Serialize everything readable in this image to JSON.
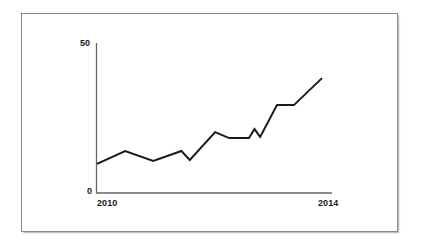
{
  "figure": {
    "frame_color": "#8a8a8a",
    "background": "#ffffff"
  },
  "chart_data": {
    "type": "line",
    "title": "",
    "subtitle": "",
    "xlabel": "",
    "ylabel": "",
    "grid": false,
    "legend": false,
    "legend_position": "none",
    "line_color": "#1a1a1a",
    "axis_color": "#666666",
    "xlim": [
      2010,
      2014
    ],
    "ylim": [
      0,
      50
    ],
    "y_tick_labels": [
      "0",
      "50"
    ],
    "y_ticks": [
      0,
      50
    ],
    "x_tick_labels": [
      "2010",
      "2014"
    ],
    "x_ticks": [
      2010,
      2014
    ],
    "x": [
      2010.0,
      2010.5,
      2011.0,
      2011.5,
      2011.65,
      2012.1,
      2012.35,
      2012.7,
      2012.8,
      2012.9,
      2013.2,
      2013.5,
      2014.0
    ],
    "values": [
      9.7,
      14.0,
      10.7,
      14.0,
      11.0,
      20.3,
      18.3,
      18.3,
      21.3,
      18.7,
      29.3,
      29.3,
      38.3
    ],
    "series": [
      {
        "name": "series-1",
        "values": [
          9.7,
          14.0,
          10.7,
          14.0,
          11.0,
          20.3,
          18.3,
          18.3,
          21.3,
          18.7,
          29.3,
          29.3,
          38.3
        ]
      }
    ],
    "annotations": []
  }
}
